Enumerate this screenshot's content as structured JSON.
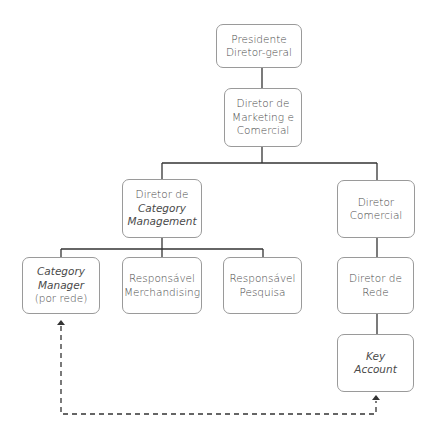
{
  "diagram": {
    "type": "org-chart",
    "nodes": [
      {
        "id": "presidente",
        "lines": [
          "Presidente",
          "Diretor-geral"
        ],
        "italic": [
          false,
          false
        ]
      },
      {
        "id": "dir-marketing",
        "lines": [
          "Diretor de",
          "Marketing e",
          "Comercial"
        ],
        "italic": [
          false,
          false,
          false
        ]
      },
      {
        "id": "dir-category",
        "lines": [
          "Diretor de",
          "Category",
          "Management"
        ],
        "italic": [
          false,
          true,
          true
        ]
      },
      {
        "id": "dir-comercial",
        "lines": [
          "Diretor",
          "Comercial"
        ],
        "italic": [
          false,
          false
        ]
      },
      {
        "id": "category-manager",
        "lines": [
          "Category",
          "Manager",
          "(por rede)"
        ],
        "italic": [
          true,
          true,
          false
        ]
      },
      {
        "id": "resp-merch",
        "lines": [
          "Responsável",
          "Merchandising"
        ],
        "italic": [
          false,
          false
        ]
      },
      {
        "id": "resp-pesquisa",
        "lines": [
          "Responsável",
          "Pesquisa"
        ],
        "italic": [
          false,
          false
        ]
      },
      {
        "id": "dir-rede",
        "lines": [
          "Diretor de",
          "Rede"
        ],
        "italic": [
          false,
          false
        ]
      },
      {
        "id": "key-account",
        "lines": [
          "Key",
          "Account"
        ],
        "italic": [
          true,
          true
        ]
      }
    ],
    "edges": [
      {
        "from": "presidente",
        "to": "dir-marketing",
        "style": "solid"
      },
      {
        "from": "dir-marketing",
        "to": "dir-category",
        "style": "solid"
      },
      {
        "from": "dir-marketing",
        "to": "dir-comercial",
        "style": "solid"
      },
      {
        "from": "dir-category",
        "to": "category-manager",
        "style": "solid"
      },
      {
        "from": "dir-category",
        "to": "resp-merch",
        "style": "solid"
      },
      {
        "from": "dir-category",
        "to": "resp-pesquisa",
        "style": "solid"
      },
      {
        "from": "dir-comercial",
        "to": "dir-rede",
        "style": "solid"
      },
      {
        "from": "dir-rede",
        "to": "key-account",
        "style": "solid"
      },
      {
        "from": "category-manager",
        "to": "key-account",
        "style": "dashed",
        "bidirectional": true
      }
    ]
  },
  "colors": {
    "line": "#333333",
    "border": "#9a9a9a",
    "text": "#4a4a4a"
  }
}
